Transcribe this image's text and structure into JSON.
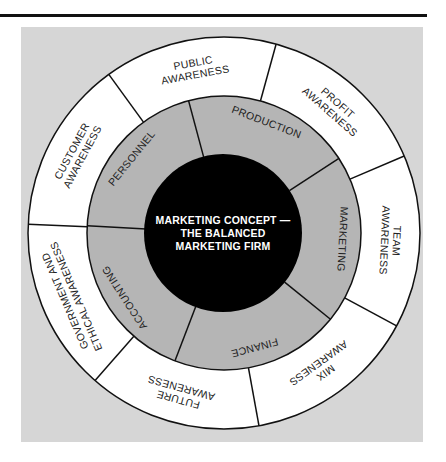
{
  "diagram": {
    "center": {
      "lines": [
        "MARKETING CONCEPT —",
        "THE BALANCED",
        "MARKETING FIRM"
      ]
    },
    "inner_ring": [
      {
        "label": "PRODUCTION"
      },
      {
        "label": "MARKETING"
      },
      {
        "label": "FINANCE"
      },
      {
        "label": "ACCOUNTING"
      },
      {
        "label": "PERSONNEL"
      }
    ],
    "outer_ring": [
      {
        "lines": [
          "PUBLIC",
          "AWARENESS"
        ]
      },
      {
        "lines": [
          "PROFIT",
          "AWARENESS"
        ]
      },
      {
        "lines": [
          "TEAM",
          "AWARENESS"
        ]
      },
      {
        "lines": [
          "MIX",
          "AWARENESS"
        ]
      },
      {
        "lines": [
          "FUTURE",
          "AWARENESS"
        ]
      },
      {
        "lines": [
          "GOVERNMENT AND",
          "ETHICAL AWARENESS"
        ]
      },
      {
        "lines": [
          "CUSTOMER",
          "AWARENESS"
        ]
      }
    ],
    "colors": {
      "background_panel": "#d6d6d6",
      "outer_ring_fill": "#ffffff",
      "inner_ring_fill": "#b5b5b5",
      "center_fill": "#000000",
      "stroke": "#111111"
    }
  }
}
